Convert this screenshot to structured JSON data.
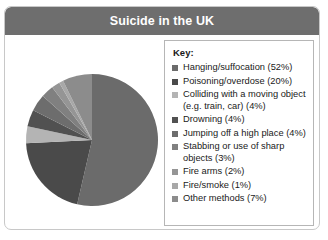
{
  "card": {
    "title": "Suicide in the UK"
  },
  "legend": {
    "title": "Key:"
  },
  "chart_data": {
    "type": "pie",
    "title": "Suicide in the UK",
    "legend_position": "right",
    "grid": false,
    "units": "percent",
    "start_angle_deg": 0,
    "direction": "clockwise",
    "categories": [
      "Hanging/suffocation",
      "Poisoning/overdose",
      "Colliding with a moving object (e.g. train, car)",
      "Drowning",
      "Jumping off a high place",
      "Stabbing or use of sharp objects",
      "Fire arms",
      "Fire/smoke",
      "Other methods"
    ],
    "values": [
      52,
      20,
      4,
      4,
      4,
      3,
      2,
      1,
      7
    ],
    "colors": [
      "#6b6b6b",
      "#4a4a4a",
      "#b4b4b4",
      "#515151",
      "#6d6d6d",
      "#808080",
      "#959595",
      "#a8a8a8",
      "#8c8c8c"
    ],
    "legend_entries": [
      "Hanging/suffocation (52%)",
      "Poisoning/overdose (20%)",
      "Colliding with a moving object\n(e.g. train, car) (4%)",
      "Drowning (4%)",
      "Jumping off a high place (4%)",
      "Stabbing or use of sharp\nobjects (3%)",
      "Fire arms (2%)",
      "Fire/smoke (1%)",
      "Other methods (7%)"
    ]
  }
}
